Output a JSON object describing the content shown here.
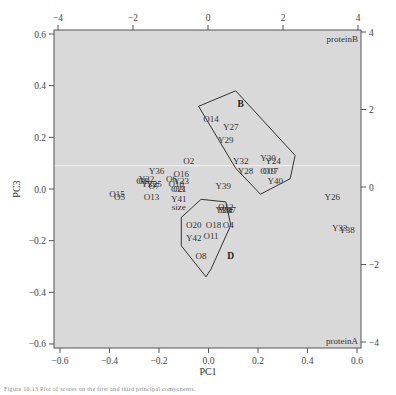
{
  "chart_data": {
    "type": "scatter",
    "title": "",
    "xlabel": "PC1",
    "ylabel": "PC3",
    "xlim": [
      -0.62,
      0.62
    ],
    "ylim": [
      -0.62,
      0.62
    ],
    "x_ticks": [
      -0.6,
      -0.4,
      -0.2,
      0.0,
      0.2,
      0.4,
      0.6
    ],
    "x_tick_labels": [
      "−0.6",
      "−0.4",
      "−0.2",
      "0.0",
      "0.2",
      "0.4",
      "0.6"
    ],
    "y_ticks": [
      -0.6,
      -0.4,
      -0.2,
      0.0,
      0.2,
      0.4,
      0.6
    ],
    "y_tick_labels": [
      "−0.6",
      "−0.4",
      "−0.2",
      "0.0",
      "0.2",
      "0.4",
      "0.6"
    ],
    "top_axis": {
      "ticks": [
        -4,
        -2,
        0,
        2,
        4
      ],
      "tick_labels": [
        "−4",
        "−2",
        "0",
        "2",
        "4"
      ]
    },
    "right_axis": {
      "ticks": [
        -4,
        -2,
        0,
        2,
        4
      ],
      "tick_labels": [
        "−4",
        "−2",
        "0",
        "2",
        "4"
      ]
    },
    "grid": false,
    "background": "#d9d9d9",
    "reference_line": {
      "y": 0.09,
      "color": "#f2f2f2"
    },
    "corner_labels": [
      {
        "text": "proteinB",
        "position": "top-right"
      },
      {
        "text": "proteinA",
        "position": "bottom-right"
      }
    ],
    "points": [
      {
        "label": "O14",
        "x": 0.01,
        "y": 0.27
      },
      {
        "label": "Y27",
        "x": 0.09,
        "y": 0.24
      },
      {
        "label": "Y29",
        "x": 0.07,
        "y": 0.19
      },
      {
        "label": "O2",
        "x": -0.08,
        "y": 0.11
      },
      {
        "label": "Y32",
        "x": 0.13,
        "y": 0.11
      },
      {
        "label": "Y30",
        "x": 0.24,
        "y": 0.12
      },
      {
        "label": "Y24",
        "x": 0.26,
        "y": 0.11
      },
      {
        "label": "Y28",
        "x": 0.15,
        "y": 0.07
      },
      {
        "label": "O19",
        "x": 0.24,
        "y": 0.07
      },
      {
        "label": "O17",
        "x": 0.25,
        "y": 0.07
      },
      {
        "label": "Y40",
        "x": 0.27,
        "y": 0.03
      },
      {
        "label": "Y36",
        "x": -0.21,
        "y": 0.07
      },
      {
        "label": "O16",
        "x": -0.11,
        "y": 0.06
      },
      {
        "label": "O6",
        "x": -0.15,
        "y": 0.04
      },
      {
        "label": "Y22",
        "x": -0.25,
        "y": 0.04
      },
      {
        "label": "O1",
        "x": -0.27,
        "y": 0.03
      },
      {
        "label": "O9",
        "x": -0.26,
        "y": 0.03
      },
      {
        "label": "Y35",
        "x": -0.24,
        "y": 0.02
      },
      {
        "label": "Y25",
        "x": -0.22,
        "y": 0.02
      },
      {
        "label": "Y23",
        "x": -0.11,
        "y": 0.03
      },
      {
        "label": "O10",
        "x": -0.13,
        "y": 0.02
      },
      {
        "label": "O7",
        "x": -0.22,
        "y": 0.01
      },
      {
        "label": "O3",
        "x": -0.12,
        "y": 0.0
      },
      {
        "label": "O21",
        "x": -0.12,
        "y": -0.0
      },
      {
        "label": "O15",
        "x": -0.37,
        "y": -0.02
      },
      {
        "label": "O5",
        "x": -0.36,
        "y": -0.03
      },
      {
        "label": "O13",
        "x": -0.23,
        "y": -0.03
      },
      {
        "label": "Y41",
        "x": -0.12,
        "y": -0.04
      },
      {
        "label": "size",
        "x": -0.12,
        "y": -0.07
      },
      {
        "label": "Y39",
        "x": 0.06,
        "y": 0.01
      },
      {
        "label": "O12",
        "x": 0.07,
        "y": -0.07
      },
      {
        "label": "Y34",
        "x": 0.06,
        "y": -0.08
      },
      {
        "label": "Y31",
        "x": 0.07,
        "y": -0.08
      },
      {
        "label": "Y37",
        "x": 0.08,
        "y": -0.08
      },
      {
        "label": "O20",
        "x": -0.06,
        "y": -0.14
      },
      {
        "label": "O18",
        "x": 0.02,
        "y": -0.14
      },
      {
        "label": "O4",
        "x": 0.08,
        "y": -0.14
      },
      {
        "label": "Y42",
        "x": -0.06,
        "y": -0.19
      },
      {
        "label": "O11",
        "x": 0.01,
        "y": -0.18
      },
      {
        "label": "O8",
        "x": -0.03,
        "y": -0.26
      },
      {
        "label": "Y26",
        "x": 0.5,
        "y": -0.03
      },
      {
        "label": "Y33",
        "x": 0.53,
        "y": -0.15
      },
      {
        "label": "Y38",
        "x": 0.56,
        "y": -0.16
      }
    ],
    "groups": [
      {
        "label": "B",
        "label_x": 0.13,
        "label_y": 0.33,
        "hull": [
          [
            -0.04,
            0.32
          ],
          [
            0.11,
            0.38
          ],
          [
            0.35,
            0.13
          ],
          [
            0.33,
            0.04
          ],
          [
            0.21,
            -0.02
          ],
          [
            0.11,
            0.08
          ]
        ]
      },
      {
        "label": "D",
        "label_x": 0.09,
        "label_y": -0.26,
        "hull": [
          [
            -0.11,
            -0.11
          ],
          [
            -0.03,
            -0.04
          ],
          [
            0.07,
            -0.05
          ],
          [
            0.09,
            -0.14
          ],
          [
            0.01,
            -0.31
          ],
          [
            -0.01,
            -0.34
          ],
          [
            -0.11,
            -0.22
          ]
        ]
      }
    ]
  },
  "caption": "Figure 10.13 Plot of scores on the first and third principal components."
}
